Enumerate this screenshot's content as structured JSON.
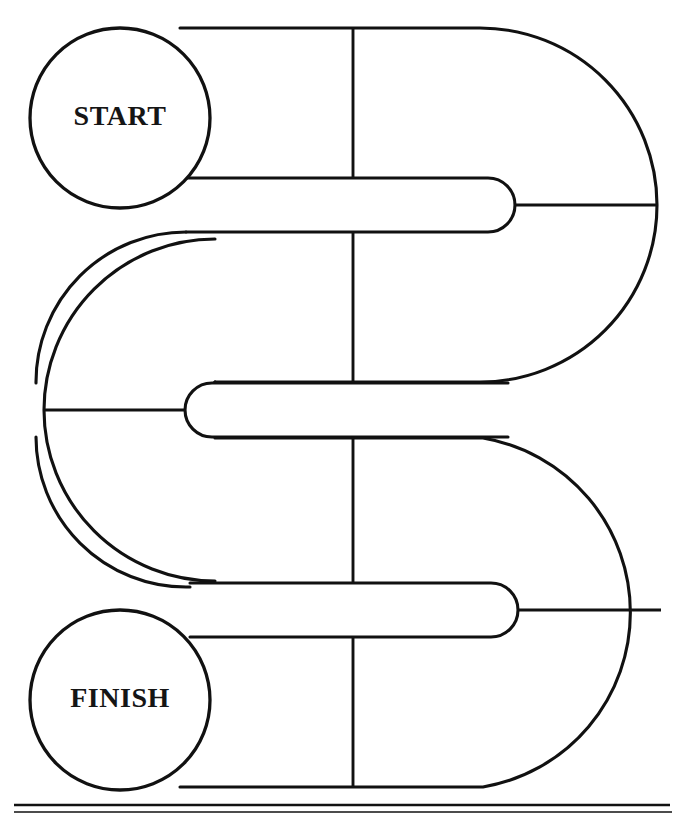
{
  "diagram": {
    "type": "s-shaped-maze-track",
    "canvas": {
      "width": 681,
      "height": 819
    },
    "background_color": "#ffffff",
    "ink_color": "#111111"
  },
  "nodes": [
    {
      "id": "start",
      "label": "START",
      "shape": "circle",
      "cx": 120,
      "cy": 118,
      "r": 90,
      "label_x": 120,
      "label_y": 119
    },
    {
      "id": "finish",
      "label": "FINISH",
      "shape": "circle",
      "cx": 120,
      "cy": 700,
      "r": 90,
      "label_x": 120,
      "label_y": 701
    }
  ],
  "track": {
    "lane_half_width": 27,
    "fingers": [
      {
        "id": "top-finger",
        "tip_x": 515,
        "center_y": 205,
        "direction": "right"
      },
      {
        "id": "middle-finger",
        "tip_x": 185,
        "center_y": 410,
        "direction": "left"
      },
      {
        "id": "bottom-finger",
        "tip_x": 518,
        "center_y": 610,
        "direction": "right"
      }
    ],
    "loops": [
      {
        "id": "upper-loop",
        "arc_center_x": 480,
        "arc_center_y": 205,
        "outer_radius": 177
      },
      {
        "id": "lower-loop",
        "arc_center_x": 215,
        "arc_center_y": 410,
        "outer_radius": 171
      },
      {
        "id": "bottom-loop",
        "arc_center_x": 483,
        "arc_center_y": 610,
        "outer_radius": 177
      }
    ],
    "dividers": [
      {
        "id": "divider-top",
        "x": 353,
        "y1": 28,
        "y2": 178,
        "orientation": "vertical"
      },
      {
        "id": "divider-upper-mid",
        "x": 353,
        "y1": 233,
        "y2": 382,
        "orientation": "vertical"
      },
      {
        "id": "divider-lower-mid",
        "x": 353,
        "y1": 437,
        "y2": 582,
        "orientation": "vertical"
      },
      {
        "id": "divider-bottom",
        "x": 353,
        "y1": 638,
        "y2": 787,
        "orientation": "vertical"
      },
      {
        "id": "divider-right-top",
        "x1": 515,
        "y": 205,
        "x2": 657,
        "orientation": "horizontal"
      },
      {
        "id": "divider-left-mid",
        "x1": 44,
        "y": 410,
        "x2": 185,
        "orientation": "horizontal"
      },
      {
        "id": "divider-right-bottom",
        "x1": 518,
        "y": 610,
        "x2": 660,
        "orientation": "horizontal"
      }
    ]
  },
  "footer_rules": [
    {
      "id": "footer-rule-upper",
      "y": 805,
      "x1": 14,
      "x2": 670,
      "weight": "medium"
    },
    {
      "id": "footer-rule-lower",
      "y": 812,
      "x1": 14,
      "x2": 672,
      "weight": "thin"
    }
  ]
}
